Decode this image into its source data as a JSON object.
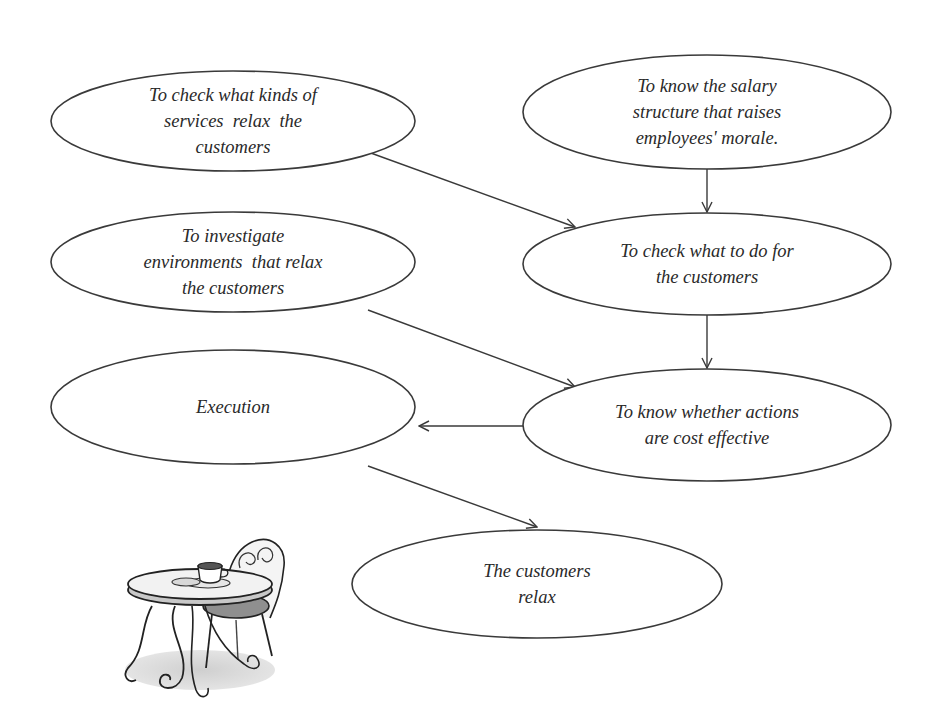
{
  "diagram": {
    "type": "flowchart",
    "colors": {
      "stroke": "#3a3a3a",
      "text": "#2a2a2a",
      "background": "#ffffff"
    },
    "nodes": [
      {
        "id": "check-services",
        "shape": "ellipse",
        "lines": [
          "To check what kinds of",
          "services  relax  the",
          "customers"
        ]
      },
      {
        "id": "salary-structure",
        "shape": "ellipse",
        "lines": [
          "To know the salary",
          "structure that raises",
          "employees' morale."
        ]
      },
      {
        "id": "investigate-environments",
        "shape": "ellipse",
        "lines": [
          "To investigate",
          "environments  that relax",
          "the customers"
        ]
      },
      {
        "id": "check-what-to-do",
        "shape": "ellipse",
        "lines": [
          "To check what to do for",
          "the customers"
        ]
      },
      {
        "id": "execution",
        "shape": "ellipse",
        "lines": [
          "Execution"
        ]
      },
      {
        "id": "cost-effective",
        "shape": "ellipse",
        "lines": [
          "To know whether actions",
          "are cost effective"
        ]
      },
      {
        "id": "customers-relax",
        "shape": "ellipse",
        "lines": [
          "The customers",
          "relax"
        ]
      }
    ],
    "edges": [
      {
        "from": "check-services",
        "to": "check-what-to-do"
      },
      {
        "from": "salary-structure",
        "to": "check-what-to-do"
      },
      {
        "from": "investigate-environments",
        "to": "cost-effective"
      },
      {
        "from": "check-what-to-do",
        "to": "cost-effective"
      },
      {
        "from": "cost-effective",
        "to": "execution"
      },
      {
        "from": "execution",
        "to": "customers-relax"
      }
    ],
    "illustration": "cafe-table-and-chair-with-coffee-cup"
  }
}
